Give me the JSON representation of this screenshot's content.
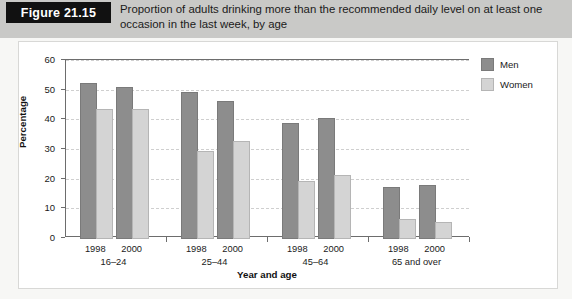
{
  "figure": {
    "tag_label": "Figure 21.15",
    "caption": "Proportion of adults drinking more than the recommended daily level on at least one occasion in the last week, by age"
  },
  "legend": {
    "position": "right",
    "entries": [
      {
        "label": "Men",
        "color": "#8d8d8d"
      },
      {
        "label": "Women",
        "color": "#d4d4d4"
      }
    ]
  },
  "chart_data": {
    "type": "bar",
    "title": "Proportion of adults drinking more than the recommended daily level on at least one occasion in the last week, by age",
    "xlabel": "Year and age",
    "ylabel": "Percentage",
    "ylim": [
      0,
      60
    ],
    "yticks": [
      0,
      10,
      20,
      30,
      40,
      50,
      60
    ],
    "grid": true,
    "categories": [
      "16–24 1998",
      "16–24 2000",
      "25–44 1998",
      "25–44 2000",
      "45–64 1998",
      "45–64 2000",
      "65 and over 1998",
      "65 and over 2000"
    ],
    "age_groups": [
      {
        "label": "16–24",
        "years": [
          "1998",
          "2000"
        ]
      },
      {
        "label": "25–44",
        "years": [
          "1998",
          "2000"
        ]
      },
      {
        "label": "45–64",
        "years": [
          "1998",
          "2000"
        ]
      },
      {
        "label": "65 and over",
        "years": [
          "1998",
          "2000"
        ]
      }
    ],
    "series": [
      {
        "name": "Men",
        "color": "#8d8d8d",
        "values": [
          52,
          50.5,
          49,
          46,
          38.5,
          40,
          17,
          17.5
        ]
      },
      {
        "name": "Women",
        "color": "#d4d4d4",
        "values": [
          43,
          43,
          29,
          32.5,
          19,
          21,
          6,
          5
        ]
      }
    ]
  }
}
